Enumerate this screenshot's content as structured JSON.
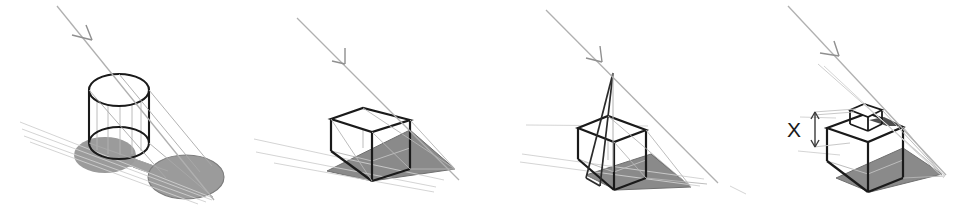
{
  "figure": {
    "title": "",
    "background_color": "#ffffff",
    "width": 974,
    "height": 209,
    "panel_count": 4,
    "colors": {
      "object_outline": "#1a1a1a",
      "object_hidden_edge": "#b9b9b9",
      "light_ray": "#c9c9c9",
      "light_ray_dark": "#8c8c8c",
      "shadow_fill": "#8a8a8a",
      "shadow_fill_light": "#9b9b9b",
      "shadow_outline": "#6f6f6f",
      "dimension_line": "#3a3a3a",
      "label_text": "#1a1a1a"
    },
    "panels": [
      {
        "id": "panel-1",
        "name": "cylinder-shadow-panel",
        "object": "cylinder",
        "shadow_shape": "stadium",
        "has_light_ray_arrow": true,
        "label": ""
      },
      {
        "id": "panel-2",
        "name": "cube-shadow-panel",
        "object": "cube",
        "shadow_shape": "parallelogram",
        "has_light_ray_arrow": true,
        "label": ""
      },
      {
        "id": "panel-3",
        "name": "cube-with-pole-panel",
        "object": "cube-with-pole",
        "shadow_shape": "parallelogram",
        "has_light_ray_arrow": true,
        "label": ""
      },
      {
        "id": "panel-4",
        "name": "stacked-cubes-dimension-panel",
        "object": "cube-with-small-cube-on-top",
        "shadow_shape": "parallelogram",
        "has_light_ray_arrow": true,
        "label": "X",
        "dimension_label": "X",
        "dimension_arrow": "double-headed-vertical"
      }
    ]
  }
}
